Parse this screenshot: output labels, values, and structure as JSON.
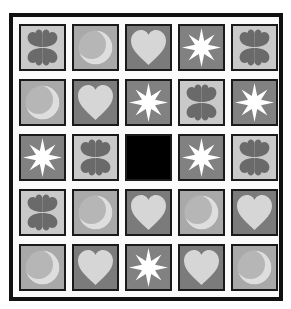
{
  "game": {
    "type": "tile-grid-puzzle",
    "rows": 5,
    "cols": 5,
    "empty_cell": {
      "row": 2,
      "col": 2
    },
    "grid": [
      [
        "clover",
        "moon",
        "heart",
        "star",
        "clover"
      ],
      [
        "moon",
        "heart",
        "star",
        "clover",
        "star"
      ],
      [
        "star",
        "clover",
        "empty",
        "star",
        "clover"
      ],
      [
        "clover",
        "moon",
        "heart",
        "moon",
        "heart"
      ],
      [
        "moon",
        "heart",
        "star",
        "heart",
        "moon"
      ]
    ]
  },
  "colors": {
    "frame": "#111111",
    "clover_bg": "#c9c9c9",
    "clover_fg": "#6a6a6a",
    "moon_bg": "#a9a9a9",
    "moon_fg": "#dedede",
    "heart_bg": "#7b7b7b",
    "heart_fg": "#d6d6d6",
    "star_bg": "#818181",
    "star_fg": "#ffffff",
    "empty": "#000000"
  }
}
